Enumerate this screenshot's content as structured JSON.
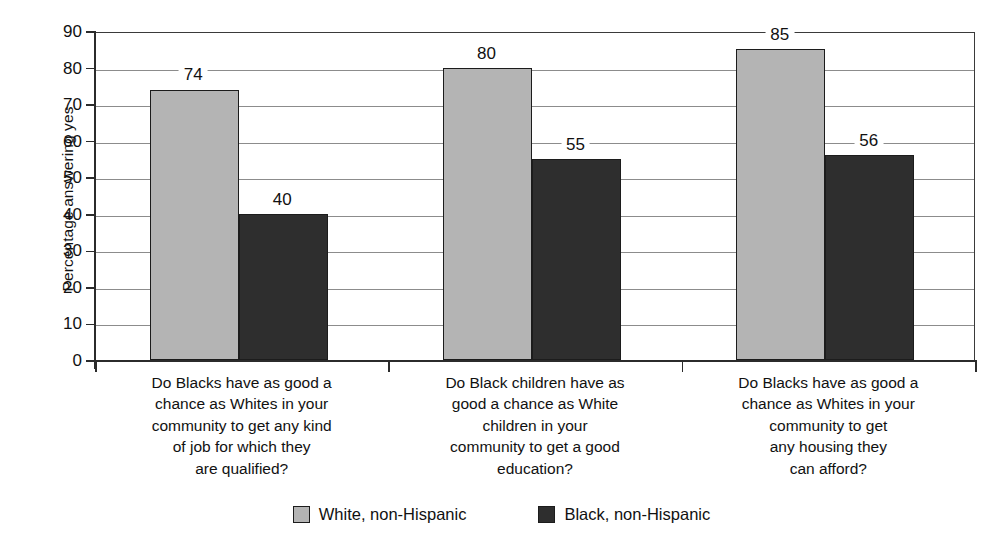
{
  "chart_data": {
    "type": "bar",
    "title": "",
    "xlabel": "",
    "ylabel": "Percentage answering yes",
    "ylim": [
      0,
      90
    ],
    "ytick_step": 10,
    "yticks": [
      0,
      10,
      20,
      30,
      40,
      50,
      60,
      70,
      80,
      90
    ],
    "grid": true,
    "legend_position": "bottom",
    "categories": [
      "Do Blacks have as good a chance as Whites in your community to get any kind of job for which they are qualified?",
      "Do Black children have as good a chance as White children in your community to get a good education?",
      "Do Blacks have as good a chance as Whites in your community to get any housing they can afford?"
    ],
    "category_lines": [
      [
        "Do Blacks have as good a",
        "chance as Whites in your",
        "community to get any kind",
        "of job for which they",
        "are qualified?"
      ],
      [
        "Do Black children have as",
        "good a chance as White",
        "children in your",
        "community to get a good",
        "education?"
      ],
      [
        "Do Blacks have as good a",
        "chance as Whites in your",
        "community to get",
        "any housing they",
        "can afford?"
      ]
    ],
    "series": [
      {
        "name": "White, non-Hispanic",
        "color": "#b4b4b4",
        "values": [
          74,
          80,
          85
        ]
      },
      {
        "name": "Black, non-Hispanic",
        "color": "#2e2e2e",
        "values": [
          40,
          55,
          56
        ]
      }
    ]
  },
  "legend": {
    "items": [
      {
        "label": "White, non-Hispanic"
      },
      {
        "label": "Black, non-Hispanic"
      }
    ]
  }
}
